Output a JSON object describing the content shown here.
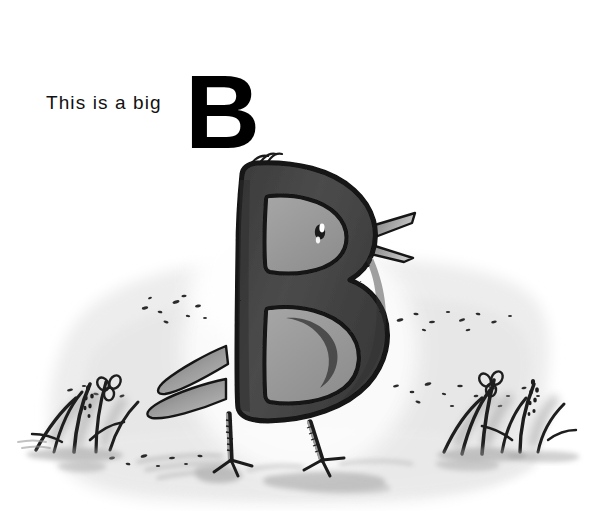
{
  "page": {
    "background_color": "#ffffff",
    "width": 593,
    "height": 511
  },
  "caption": {
    "text": "This is a big",
    "big_letter": "B",
    "text_color": "#111111",
    "letter_color": "#000000"
  },
  "illustration": {
    "title": "Letter B as a bird standing on the ground",
    "alt_text": "A capital letter B drawn as a bird with a beak, eye, wing, two legs and feather tufts, standing on a washed grey ground with grass tufts on either side",
    "subject": {
      "name": "letter-b-bird",
      "letter": "B",
      "body_color": "#454545",
      "body_shadow_color": "#343434",
      "outline_color": "#121212",
      "counter_color": "#9a9a9a",
      "counter_shadow_color": "#8a8a8a",
      "eye": {
        "pupil_color": "#1a1a1a",
        "highlight_color": "#ffffff"
      },
      "beak": {
        "fill_color": "#8f8f8f",
        "outline_color": "#161616",
        "mandibles": 2,
        "direction": "right"
      },
      "feather_tufts": {
        "count": 3,
        "color": "#1a1a1a",
        "position": "top-left"
      },
      "wing": {
        "fill_color": "#8d8d8d",
        "outline_color": "#151515",
        "feathers": 2,
        "position": "left"
      },
      "legs": {
        "count": 2,
        "color": "#1c1c1c",
        "texture": "scaly-ladder",
        "toes_per_foot": 3
      }
    },
    "background": {
      "wash_color": "#eeeeee",
      "wash_edge_color": "#e3e3e3",
      "halo_color": "#fbfbfb",
      "ground_shadow_color": "#a9a9a9",
      "speckle_color": "#2a2a2a",
      "speckle_bands": 4
    },
    "plants": [
      {
        "name": "grass-tuft-left",
        "side": "left",
        "blade_color": "#1e1e1e",
        "wash_color": "#9e9e9e",
        "flower": "clover",
        "flower_count": 1,
        "seed_head_count": 1
      },
      {
        "name": "grass-tuft-right",
        "side": "right",
        "blade_color": "#1e1e1e",
        "wash_color": "#9e9e9e",
        "flower": "clover",
        "flower_count": 1,
        "seed_head_count": 1
      }
    ]
  }
}
